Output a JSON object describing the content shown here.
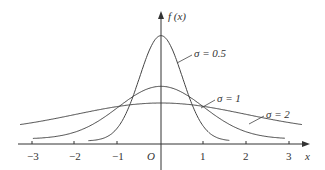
{
  "chart_data": {
    "type": "line",
    "title": "",
    "xlabel": "x",
    "ylabel": "f(x)",
    "origin_label": "O",
    "xlim": [
      -3.3,
      3.4
    ],
    "x_ticks": [
      -3,
      -2,
      -1,
      1,
      2,
      3
    ],
    "x_tick_labels": [
      "−3",
      "−2",
      "−1",
      "1",
      "2",
      "3"
    ],
    "grid": false,
    "legend": "inline annotations",
    "series": [
      {
        "name": "σ = 0.5",
        "sigma": 0.5,
        "mu": 0,
        "peak": 0.798,
        "x_range": [
          -1.7,
          1.6
        ]
      },
      {
        "name": "σ = 1",
        "sigma": 1,
        "mu": 0,
        "peak": 0.399,
        "x_range": [
          -3,
          2.9
        ]
      },
      {
        "name": "σ = 2",
        "sigma": 2,
        "mu": 0,
        "peak": 0.199,
        "x_range": [
          -3.3,
          3.3
        ]
      }
    ],
    "annotations": [
      {
        "text": "σ = 0.5",
        "points_to": {
          "x": 0.4,
          "series": "σ = 0.5"
        }
      },
      {
        "text": "σ = 1",
        "points_to": {
          "x": 1.0,
          "series": "σ = 1"
        }
      },
      {
        "text": "σ = 2",
        "points_to": {
          "x": 2.1,
          "series": "σ = 2"
        }
      }
    ]
  },
  "labels": {
    "y_axis": "f (x)",
    "x_axis": "x",
    "origin": "O",
    "ticks": [
      "−3",
      "−2",
      "−1",
      "1",
      "2",
      "3"
    ],
    "s05": "σ = 0.5",
    "s1": "σ = 1",
    "s2": "σ = 2"
  }
}
